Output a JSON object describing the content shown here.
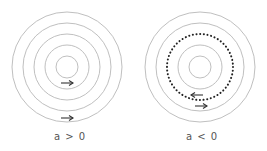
{
  "panels": [
    {
      "label": "a > 0",
      "center": [
        67,
        67
      ],
      "rings": [
        11,
        22,
        33,
        44,
        55
      ],
      "dotted_ring": null,
      "arrows": [
        {
          "x": 67,
          "y": 83,
          "dir": "right"
        },
        {
          "x": 67,
          "y": 118,
          "dir": "right"
        }
      ]
    },
    {
      "label": "a < 0",
      "center": [
        200,
        67
      ],
      "rings": [
        11,
        22,
        44,
        55
      ],
      "dotted_ring": 33,
      "arrows": [
        {
          "x": 197,
          "y": 95,
          "dir": "left"
        },
        {
          "x": 201,
          "y": 106,
          "dir": "right"
        }
      ]
    }
  ],
  "colors": {
    "ring": "#b8b8b8",
    "dots": "#222222",
    "arrow": "#333333",
    "label": "#555555"
  }
}
